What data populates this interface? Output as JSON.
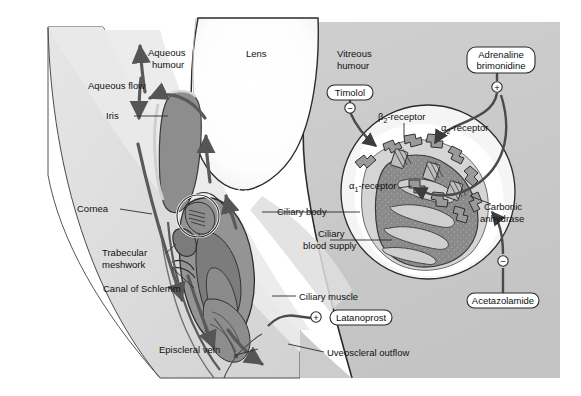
{
  "figure": {
    "background_color": "#ffffff"
  },
  "palette": {
    "sclera": "#d6d6d6",
    "sclera_light": "#e3e3e3",
    "vitreous": "#c9c9c9",
    "iris": "#8d8d8d",
    "ciliary_body": "#9a9a9a",
    "ciliary_dark": "#7e7e7e",
    "lens": "#ffffff",
    "inset_ring": "#f2f2f2",
    "outline": "#2b2b2b",
    "arrow": "#555555",
    "text": "#111111"
  },
  "anatomy_labels": [
    {
      "id": "aqueous-humour",
      "text": "Aqueous\nhumour",
      "lines": [
        "Aqueous",
        "humour"
      ],
      "x": 148,
      "y": 56,
      "anchor": "start"
    },
    {
      "id": "aqueous-flow",
      "text": "Aqueous flow",
      "lines": [
        "Aqueous flow"
      ],
      "x": 88,
      "y": 89,
      "anchor": "start"
    },
    {
      "id": "iris",
      "text": "Iris",
      "lines": [
        "Iris"
      ],
      "x": 106,
      "y": 118,
      "anchor": "start"
    },
    {
      "id": "lens",
      "text": "Lens",
      "lines": [
        "Lens"
      ],
      "x": 246,
      "y": 57,
      "anchor": "start"
    },
    {
      "id": "vitreous-humour",
      "text": "Vitreous\nhumour",
      "lines": [
        "Vitreous",
        "humour"
      ],
      "x": 337,
      "y": 57,
      "anchor": "start"
    },
    {
      "id": "cornea",
      "text": "Cornea",
      "lines": [
        "Cornea"
      ],
      "x": 77,
      "y": 212,
      "anchor": "start"
    },
    {
      "id": "trabecular-meshwork",
      "text": "Trabecular\nmeshwork",
      "lines": [
        "Trabecular",
        "meshwork"
      ],
      "x": 102,
      "y": 256,
      "anchor": "start"
    },
    {
      "id": "canal-of-schlemm",
      "text": "Canal of Schlemm",
      "lines": [
        "Canal of Schlemm"
      ],
      "x": 103,
      "y": 291,
      "anchor": "start"
    },
    {
      "id": "episcleral-vein",
      "text": "Episcleral vein",
      "lines": [
        "Episcleral vein"
      ],
      "x": 159,
      "y": 352,
      "anchor": "start"
    },
    {
      "id": "ciliary-body",
      "text": "Ciliary body",
      "lines": [
        "Ciliary body"
      ],
      "x": 277,
      "y": 215,
      "anchor": "start"
    },
    {
      "id": "ciliary-blood-supply",
      "text": "Ciliary\nblood supply",
      "lines": [
        "Ciliary",
        "blood supply"
      ],
      "x": 306,
      "y": 238,
      "anchor": "start"
    },
    {
      "id": "ciliary-muscle",
      "text": "Ciliary muscle",
      "lines": [
        "Ciliary muscle"
      ],
      "x": 299,
      "y": 299,
      "anchor": "start"
    },
    {
      "id": "uveoscleral-outflow",
      "text": "Uveoscleral outflow",
      "lines": [
        "Uveoscleral outflow"
      ],
      "x": 327,
      "y": 355,
      "anchor": "start"
    }
  ],
  "receptor_labels": [
    {
      "id": "beta2-receptor",
      "base": "β",
      "sub": "2",
      "tail": "-receptor",
      "x": 378,
      "y": 119,
      "anchor": "start"
    },
    {
      "id": "alpha2-receptor",
      "base": "α",
      "sub": "2",
      "tail": "-receptor",
      "x": 441,
      "y": 130,
      "anchor": "start"
    },
    {
      "id": "alpha1-receptor",
      "base": "α",
      "sub": "1",
      "tail": "-receptor",
      "x": 349,
      "y": 187,
      "anchor": "start"
    },
    {
      "id": "carbonic-anhydrase",
      "base": "",
      "sub": "",
      "tail": "",
      "x": 0,
      "y": 0,
      "anchor": "start",
      "lines": [
        "Carbonic",
        "anhydrase"
      ],
      "lx": 484,
      "ly": 210
    }
  ],
  "drug_boxes": [
    {
      "id": "timolol",
      "lines": [
        "Timolol"
      ],
      "x": 327,
      "y": 85,
      "w": 46,
      "h": 15,
      "sign": "−",
      "sign_x": 348,
      "sign_y": 108
    },
    {
      "id": "adrenaline-brimonidine",
      "lines": [
        "Adrenaline",
        "brimonidine"
      ],
      "x": 467,
      "y": 47,
      "w": 68,
      "h": 26,
      "sign": "+",
      "sign_x": 497,
      "sign_y": 87
    },
    {
      "id": "acetazolamide",
      "lines": [
        "Acetazolamide"
      ],
      "x": 467,
      "y": 293,
      "w": 72,
      "h": 15,
      "sign": "−",
      "sign_x": 521,
      "sign_y": 261
    },
    {
      "id": "latanoprost",
      "lines": [
        "Latanoprost"
      ],
      "x": 330,
      "y": 310,
      "w": 62,
      "h": 15,
      "sign": "+",
      "sign_x": 318,
      "sign_y": 318
    }
  ],
  "inset": {
    "id": "ciliary-epithelium-magnification",
    "center_x": 428,
    "center_y": 192,
    "radius": 87
  }
}
